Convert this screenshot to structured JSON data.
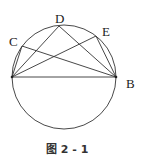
{
  "figure": {
    "caption": "图 2 - 1",
    "labels": {
      "C": "C",
      "D": "D",
      "E": "E",
      "B": "B"
    },
    "circle": {
      "cx": 64,
      "cy": 77,
      "r": 52
    },
    "points": {
      "A": {
        "x": 12,
        "y": 77
      },
      "B": {
        "x": 116,
        "y": 77
      },
      "C": {
        "x": 22,
        "y": 46
      },
      "D": {
        "x": 59,
        "y": 26
      },
      "E": {
        "x": 96,
        "y": 36
      }
    },
    "colors": {
      "stroke": "#333333"
    }
  }
}
